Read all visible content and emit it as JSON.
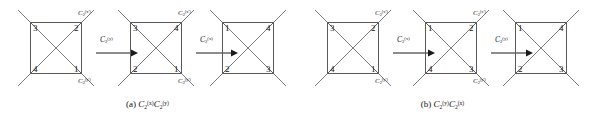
{
  "figure": {
    "background": "#ffffff",
    "line_color": "#5a5a5a",
    "text_color": "#111111"
  },
  "panels": [
    {
      "id": "a",
      "caption": "(a) C2(x)C2(y)",
      "caption_parts": {
        "prefix": "(a)",
        "op1": "C",
        "sub1": "2",
        "sup1": "(x)",
        "op2": "C",
        "sub2": "2",
        "sup2": "(y)"
      },
      "axis_labels": {
        "top_right": {
          "base": "C",
          "sub": "2",
          "sup": "(x')"
        },
        "bottom_right": {
          "base": "C",
          "sub": "2",
          "sup": "(y')"
        }
      },
      "stages": [
        {
          "name": "initial-square",
          "vertices": {
            "top_left": "3",
            "top_right": "2",
            "bottom_left": "4",
            "bottom_right": "1"
          }
        },
        {
          "name": "after-first-rotation",
          "vertices": {
            "top_left": "3",
            "top_right": "4",
            "bottom_left": "2",
            "bottom_right": "1"
          }
        },
        {
          "name": "after-second-rotation",
          "vertices": {
            "top_left": "1",
            "top_right": "4",
            "bottom_left": "2",
            "bottom_right": "3"
          }
        }
      ],
      "arrows": [
        {
          "name": "arrow-first",
          "base": "C",
          "sub": "2",
          "sup": "(y)"
        },
        {
          "name": "arrow-second",
          "base": "C",
          "sub": "2",
          "sup": "(x)"
        }
      ]
    },
    {
      "id": "b",
      "caption": "(b) C2(y)C2(x)",
      "caption_parts": {
        "prefix": "(b)",
        "op1": "C",
        "sub1": "2",
        "sup1": "(y)",
        "op2": "C",
        "sub2": "2",
        "sup2": "(x)"
      },
      "axis_labels": {
        "top_right": {
          "base": "C",
          "sub": "2",
          "sup": "(x')"
        },
        "bottom_right": {
          "base": "C",
          "sub": "2",
          "sup": "(y')"
        }
      },
      "stages": [
        {
          "name": "initial-square",
          "vertices": {
            "top_left": "3",
            "top_right": "2",
            "bottom_left": "4",
            "bottom_right": "1"
          }
        },
        {
          "name": "after-first-rotation",
          "vertices": {
            "top_left": "1",
            "top_right": "2",
            "bottom_left": "4",
            "bottom_right": "3"
          }
        },
        {
          "name": "after-second-rotation",
          "vertices": {
            "top_left": "1",
            "top_right": "4",
            "bottom_left": "2",
            "bottom_right": "3"
          }
        }
      ],
      "arrows": [
        {
          "name": "arrow-first",
          "base": "C",
          "sub": "2",
          "sup": "(x)"
        },
        {
          "name": "arrow-second",
          "base": "C",
          "sub": "2",
          "sup": "(y)"
        }
      ]
    }
  ]
}
